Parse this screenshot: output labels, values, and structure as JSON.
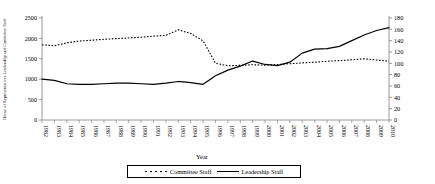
{
  "chart_data": {
    "type": "line",
    "title": "",
    "xlabel": "Year",
    "ylabel_left": "House of Representatives Leadership and Committee Staff",
    "ylabel_right": "",
    "x": [
      1982,
      1983,
      1984,
      1985,
      1986,
      1987,
      1988,
      1989,
      1990,
      1991,
      1992,
      1993,
      1994,
      1995,
      1996,
      1997,
      1998,
      1999,
      2000,
      2001,
      2002,
      2003,
      2004,
      2005,
      2006,
      2007,
      2008,
      2009,
      2010
    ],
    "categories": [
      "1982",
      "1983",
      "1984",
      "1985",
      "1986",
      "1987",
      "1988",
      "1989",
      "1990",
      "1991",
      "1992",
      "1993",
      "1994",
      "1995",
      "1996",
      "1997",
      "1998",
      "1999",
      "2000",
      "2001",
      "2002",
      "2003",
      "2004",
      "2005",
      "2006",
      "2007",
      "2008",
      "2009",
      "2010"
    ],
    "series": [
      {
        "name": "Committee Staff",
        "style": "dotted",
        "axis": "left",
        "values": [
          1843,
          1820,
          1890,
          1935,
          1955,
          1978,
          1995,
          2010,
          2030,
          2055,
          2075,
          2210,
          2120,
          1940,
          1390,
          1330,
          1340,
          1355,
          1345,
          1360,
          1380,
          1400,
          1415,
          1440,
          1455,
          1475,
          1500,
          1470,
          1440
        ]
      },
      {
        "name": "Leadership Staff",
        "style": "solid",
        "axis": "right",
        "values": [
          72,
          70,
          64,
          63,
          63,
          64,
          65,
          65,
          64,
          63,
          65,
          68,
          66,
          63,
          78,
          88,
          95,
          104,
          98,
          96,
          102,
          118,
          125,
          126,
          130,
          140,
          150,
          158,
          163
        ]
      }
    ],
    "ylim_left": [
      0,
      2500
    ],
    "yticks_left": [
      0,
      500,
      1000,
      1500,
      2000,
      2500
    ],
    "ylim_right": [
      0,
      180
    ],
    "yticks_right": [
      0,
      20,
      40,
      60,
      80,
      100,
      120,
      140,
      160,
      180
    ],
    "grid": false,
    "legend_position": "bottom",
    "legend": [
      {
        "label": "Committee Staff",
        "style": "dotted"
      },
      {
        "label": "Leadership Staff",
        "style": "solid"
      }
    ],
    "colors": {
      "line": "#000000",
      "axis": "#808080",
      "background": "#ffffff"
    }
  }
}
